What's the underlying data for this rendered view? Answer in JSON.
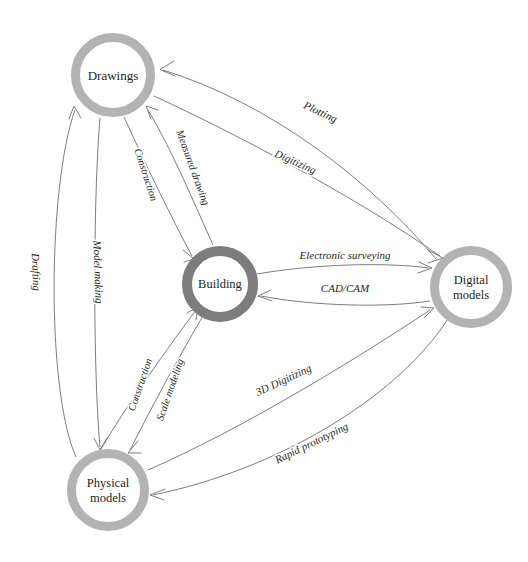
{
  "diagram": {
    "type": "directed-graph",
    "background_color": "#ffffff",
    "edge_color": "#6e6e6e",
    "text_color": "#231f20",
    "nodes": [
      {
        "id": "drawings",
        "label": "Drawings",
        "label_lines": [
          "Drawings"
        ],
        "cx": 113,
        "cy": 75,
        "r": 42,
        "ring_width": 9,
        "ring_color": "#b3b3b3",
        "fill_color": "#ffffff",
        "font_size": 13
      },
      {
        "id": "building",
        "label": "Building",
        "label_lines": [
          "Building"
        ],
        "cx": 220,
        "cy": 284,
        "r": 38,
        "ring_width": 10,
        "ring_color": "#7c7c7c",
        "fill_color": "#ffffff",
        "font_size": 12.5
      },
      {
        "id": "digital",
        "label": "Digital models",
        "label_lines": [
          "Digital",
          "models"
        ],
        "cx": 471,
        "cy": 287,
        "r": 41,
        "ring_width": 9,
        "ring_color": "#b3b3b3",
        "fill_color": "#ffffff",
        "font_size": 12.5
      },
      {
        "id": "physical",
        "label": "Physical models",
        "label_lines": [
          "Physical",
          "models"
        ],
        "cx": 108,
        "cy": 490,
        "r": 41,
        "ring_width": 9,
        "ring_color": "#b3b3b3",
        "fill_color": "#ffffff",
        "font_size": 12.5
      }
    ],
    "edges": [
      {
        "id": "plotting",
        "label": "Plotting",
        "from": "digital",
        "to": "drawings",
        "label_x": 320,
        "label_y": 113,
        "label_rotate": 25,
        "font_size": 11
      },
      {
        "id": "digitizing",
        "label": "Digitizing",
        "from": "drawings",
        "to": "digital",
        "label_x": 295,
        "label_y": 163,
        "label_rotate": 24,
        "font_size": 11
      },
      {
        "id": "measured-drawing",
        "label": "Measured drawing",
        "from": "building",
        "to": "drawings",
        "label_x": 192,
        "label_y": 168,
        "label_rotate": 70,
        "font_size": 10.5
      },
      {
        "id": "construction-top",
        "label": "Construction",
        "from": "drawings",
        "to": "building",
        "label_x": 145,
        "label_y": 175,
        "label_rotate": 72,
        "font_size": 10.5
      },
      {
        "id": "drafting",
        "label": "Drafting",
        "from": "physical",
        "to": "drawings",
        "label_x": 35,
        "label_y": 272,
        "label_rotate": 88,
        "font_size": 11
      },
      {
        "id": "model-making",
        "label": "Model making",
        "from": "drawings",
        "to": "physical",
        "label_x": 97,
        "label_y": 272,
        "label_rotate": 88,
        "font_size": 11
      },
      {
        "id": "electronic-surveying",
        "label": "Electronic surveying",
        "from": "building",
        "to": "digital",
        "label_x": 345,
        "label_y": 256,
        "label_rotate": 0,
        "font_size": 11
      },
      {
        "id": "cad-cam",
        "label": "CAD/CAM",
        "from": "digital",
        "to": "building",
        "label_x": 345,
        "label_y": 289,
        "label_rotate": 0,
        "font_size": 11
      },
      {
        "id": "construction-bottom",
        "label": "Construction",
        "from": "physical",
        "to": "building",
        "label_x": 141,
        "label_y": 385,
        "label_rotate": -71,
        "font_size": 10.5
      },
      {
        "id": "scale-modeling",
        "label": "Scale modeling",
        "from": "building",
        "to": "physical",
        "label_x": 171,
        "label_y": 390,
        "label_rotate": -71,
        "font_size": 10.5
      },
      {
        "id": "3d-digitizing",
        "label": "3D Digitizing",
        "from": "physical",
        "to": "digital",
        "label_x": 284,
        "label_y": 381,
        "label_rotate": -25,
        "font_size": 11
      },
      {
        "id": "rapid-prototyping",
        "label": "Rapid prototyping",
        "from": "digital",
        "to": "physical",
        "label_x": 312,
        "label_y": 444,
        "label_rotate": -26,
        "font_size": 11
      }
    ]
  }
}
